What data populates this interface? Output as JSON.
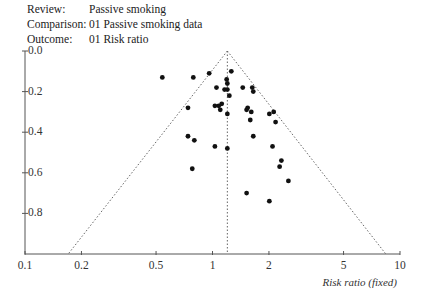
{
  "header": {
    "rows": [
      {
        "key": "Review:",
        "value": "Passive smoking"
      },
      {
        "key": "Comparison:",
        "value": "01 Passive smoking data"
      },
      {
        "key": "Outcome:",
        "value": "01 Risk ratio"
      }
    ]
  },
  "chart_data": {
    "type": "scatter",
    "subtype": "funnel plot",
    "title": "",
    "xlabel": "Risk ratio (fixed)",
    "ylabel": "SE(log RR)",
    "x_scale": "log",
    "x_ticks": [
      0.1,
      0.2,
      0.5,
      1,
      2,
      5,
      10
    ],
    "x_tick_labels": [
      "0.1",
      "0.2",
      "0.5",
      "1",
      "2",
      "5",
      "10"
    ],
    "xlim": [
      0.1,
      10
    ],
    "y_ticks": [
      0.0,
      0.2,
      0.4,
      0.6,
      0.8
    ],
    "y_tick_labels": [
      "0.0",
      "0.2",
      "0.4",
      "0.6",
      "0.8"
    ],
    "ylim": [
      0.0,
      1.0
    ],
    "y_inverted": true,
    "grid": false,
    "pooled_estimate": 1.2,
    "funnel": {
      "apex": [
        1.2,
        0.0
      ],
      "bottom_left": [
        0.17,
        1.0
      ],
      "bottom_right": [
        8.4,
        1.0
      ],
      "style": "dotted"
    },
    "points": [
      {
        "rr": 0.54,
        "se": 0.13
      },
      {
        "rr": 0.79,
        "se": 0.13
      },
      {
        "rr": 0.96,
        "se": 0.11
      },
      {
        "rr": 1.26,
        "se": 0.1
      },
      {
        "rr": 1.19,
        "se": 0.14
      },
      {
        "rr": 1.2,
        "se": 0.16
      },
      {
        "rr": 1.05,
        "se": 0.18
      },
      {
        "rr": 1.16,
        "se": 0.19
      },
      {
        "rr": 1.2,
        "se": 0.19
      },
      {
        "rr": 1.23,
        "se": 0.22
      },
      {
        "rr": 1.45,
        "se": 0.18
      },
      {
        "rr": 1.63,
        "se": 0.18
      },
      {
        "rr": 1.65,
        "se": 0.2
      },
      {
        "rr": 0.74,
        "se": 0.28
      },
      {
        "rr": 1.03,
        "se": 0.27
      },
      {
        "rr": 1.08,
        "se": 0.27
      },
      {
        "rr": 1.12,
        "se": 0.26
      },
      {
        "rr": 1.1,
        "se": 0.29
      },
      {
        "rr": 1.2,
        "se": 0.31
      },
      {
        "rr": 1.54,
        "se": 0.28
      },
      {
        "rr": 1.52,
        "se": 0.29
      },
      {
        "rr": 1.61,
        "se": 0.3
      },
      {
        "rr": 1.59,
        "se": 0.34
      },
      {
        "rr": 2.01,
        "se": 0.31
      },
      {
        "rr": 2.12,
        "se": 0.3
      },
      {
        "rr": 2.17,
        "se": 0.35
      },
      {
        "rr": 0.74,
        "se": 0.42
      },
      {
        "rr": 0.8,
        "se": 0.44
      },
      {
        "rr": 1.03,
        "se": 0.47
      },
      {
        "rr": 1.2,
        "se": 0.48
      },
      {
        "rr": 1.65,
        "se": 0.42
      },
      {
        "rr": 2.09,
        "se": 0.47
      },
      {
        "rr": 2.33,
        "se": 0.54
      },
      {
        "rr": 2.28,
        "se": 0.57
      },
      {
        "rr": 2.54,
        "se": 0.64
      },
      {
        "rr": 0.78,
        "se": 0.58
      },
      {
        "rr": 1.52,
        "se": 0.7
      },
      {
        "rr": 2.01,
        "se": 0.74
      }
    ]
  },
  "colors": {
    "axis": "#555555",
    "points": "#111111",
    "funnel": "#666666"
  }
}
